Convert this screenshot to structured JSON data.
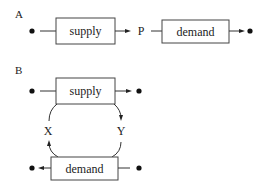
{
  "panels": {
    "a": {
      "label": "A",
      "box1": "supply",
      "mid": "P",
      "box2": "demand"
    },
    "b": {
      "label": "B",
      "top_box": "supply",
      "bottom_box": "demand",
      "left_arc": "X",
      "right_arc": "Y"
    }
  }
}
